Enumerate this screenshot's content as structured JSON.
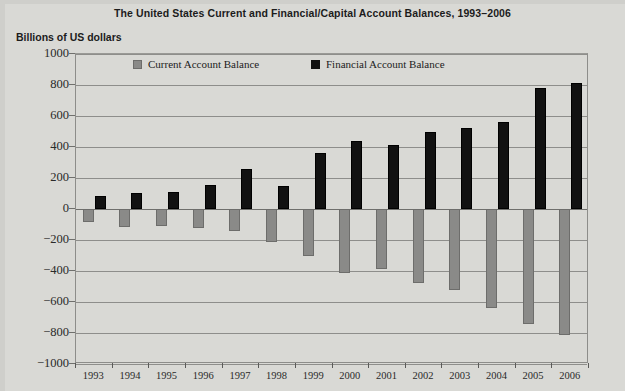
{
  "chart_data": {
    "type": "bar",
    "title": "The United States Current and Financial/Capital Account Balances, 1993–2006",
    "xlabel": "",
    "ylabel": "Billions of US dollars",
    "categories": [
      "1993",
      "1994",
      "1995",
      "1996",
      "1997",
      "1998",
      "1999",
      "2000",
      "2001",
      "2002",
      "2003",
      "2004",
      "2005",
      "2006"
    ],
    "series": [
      {
        "name": "Current Account Balance",
        "color": "#8a8a88",
        "values": [
          -82,
          -118,
          -110,
          -120,
          -140,
          -215,
          -300,
          -415,
          -390,
          -475,
          -525,
          -640,
          -745,
          -811
        ]
      },
      {
        "name": "Financial Account Balance",
        "color": "#111111",
        "values": [
          84,
          105,
          108,
          155,
          255,
          150,
          360,
          440,
          410,
          500,
          520,
          560,
          780,
          815
        ]
      }
    ],
    "ylim": [
      -1000,
      1000
    ],
    "yticks": [
      1000,
      800,
      600,
      400,
      200,
      0,
      -200,
      -400,
      -600,
      -800,
      -1000
    ],
    "ytick_labels": [
      "1000",
      "800",
      "600",
      "400",
      "200",
      "0",
      "−200",
      "−400",
      "−600",
      "−800",
      "−1000"
    ],
    "grid": true,
    "legend_position": "inside-top",
    "background": "#d9d9d5"
  },
  "legend": {
    "entries": [
      {
        "label": "Current Account Balance",
        "swatch": "current"
      },
      {
        "label": "Financial Account Balance",
        "swatch": "financial"
      }
    ]
  }
}
